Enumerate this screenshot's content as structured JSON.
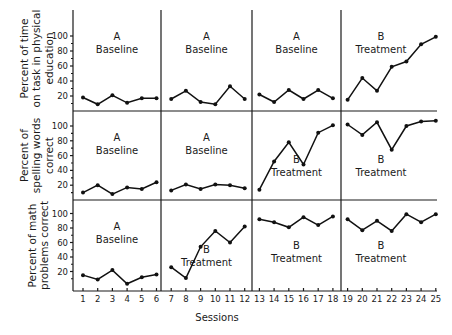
{
  "chart_data": {
    "type": "line",
    "title": "",
    "xlabel": "Sessions",
    "x": [
      1,
      2,
      3,
      4,
      5,
      6,
      7,
      8,
      9,
      10,
      11,
      12,
      13,
      14,
      15,
      16,
      17,
      18,
      19,
      20,
      21,
      22,
      23,
      24,
      25
    ],
    "x_tick_labels": [
      "1",
      "2",
      "3",
      "4",
      "5",
      "6",
      "7",
      "8",
      "9",
      "10",
      "11",
      "12",
      "13",
      "14",
      "15",
      "16",
      "17",
      "18",
      "19",
      "20",
      "21",
      "22",
      "23",
      "24",
      "25"
    ],
    "y_tick_labels": [
      "100",
      "80",
      "60",
      "40",
      "20"
    ],
    "ylim": [
      0,
      110
    ],
    "grid": false,
    "layout": "3 stacked panels (multiple-baseline design), each divided into 4 phases by vertical lines after sessions 6, 12, 18",
    "phase_breaks_after_session": [
      6,
      12,
      18
    ],
    "panels": [
      {
        "ylabel": "Percent of time on task in physical education",
        "ylabel_lines": [
          "Percent of time",
          "on task in physical",
          "education"
        ],
        "phases": [
          {
            "letter": "A",
            "name": "Baseline",
            "sessions": [
              1,
              2,
              3,
              4,
              5,
              6
            ],
            "values": [
              18,
              9,
              21,
              11,
              17,
              17
            ]
          },
          {
            "letter": "A",
            "name": "Baseline",
            "sessions": [
              7,
              8,
              9,
              10,
              11,
              12
            ],
            "values": [
              16,
              27,
              12,
              9,
              33,
              16
            ]
          },
          {
            "letter": "A",
            "name": "Baseline",
            "sessions": [
              13,
              14,
              15,
              16,
              17,
              18
            ],
            "values": [
              22,
              12,
              28,
              16,
              28,
              17
            ]
          },
          {
            "letter": "B",
            "name": "Treatment",
            "sessions": [
              19,
              20,
              21,
              22,
              23,
              24,
              25
            ],
            "values": [
              15,
              44,
              27,
              59,
              66,
              89,
              99
            ]
          }
        ]
      },
      {
        "ylabel": "Percent of spelling words correct",
        "ylabel_lines": [
          "Percent of",
          "spelling words",
          "correct"
        ],
        "phases": [
          {
            "letter": "A",
            "name": "Baseline",
            "sessions": [
              1,
              2,
              3,
              4,
              5,
              6
            ],
            "values": [
              10,
              20,
              8,
              17,
              15,
              24
            ]
          },
          {
            "letter": "A",
            "name": "Baseline",
            "sessions": [
              7,
              8,
              9,
              10,
              11,
              12
            ],
            "values": [
              13,
              21,
              15,
              21,
              20,
              16
            ]
          },
          {
            "letter": "B",
            "name": "Treatment",
            "sessions": [
              13,
              14,
              15,
              16,
              17,
              18
            ],
            "values": [
              14,
              52,
              78,
              48,
              91,
              101
            ]
          },
          {
            "letter": "B",
            "name": "Treatment",
            "sessions": [
              19,
              20,
              21,
              22,
              23,
              24,
              25
            ],
            "values": [
              102,
              88,
              105,
              68,
              100,
              106,
              107
            ]
          }
        ]
      },
      {
        "ylabel": "Percent of math problems correct",
        "ylabel_lines": [
          "Percent of math",
          "problems correct"
        ],
        "phases": [
          {
            "letter": "A",
            "name": "Baseline",
            "sessions": [
              1,
              2,
              3,
              4,
              5,
              6
            ],
            "values": [
              15,
              9,
              22,
              3,
              12,
              16
            ]
          },
          {
            "letter": "B",
            "name": "Treatment",
            "sessions": [
              7,
              8,
              9,
              10,
              11,
              12
            ],
            "values": [
              26,
              11,
              54,
              76,
              60,
              82
            ]
          },
          {
            "letter": "B",
            "name": "Treatment",
            "sessions": [
              13,
              14,
              15,
              16,
              17,
              18
            ],
            "values": [
              92,
              88,
              81,
              95,
              84,
              96
            ]
          },
          {
            "letter": "B",
            "name": "Treatment",
            "sessions": [
              19,
              20,
              21,
              22,
              23,
              24,
              25
            ],
            "values": [
              92,
              77,
              90,
              76,
              99,
              88,
              99
            ]
          }
        ]
      }
    ]
  },
  "colors": {
    "line": "#111111",
    "axis": "#1a1a1a",
    "background": "#ffffff"
  }
}
